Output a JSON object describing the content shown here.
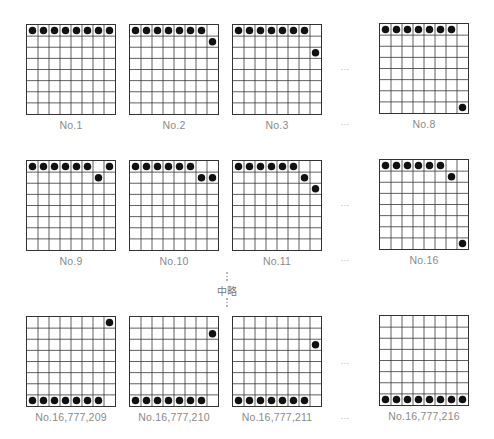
{
  "diagram": {
    "grid_size": 8,
    "colors": {
      "line": "#333333",
      "stone": "#111111",
      "label": "#8a8a8a"
    },
    "omission_label": "中略",
    "ellipsis": "…",
    "boards": [
      {
        "label": "No.1",
        "x": 26,
        "y": 24,
        "stones": [
          [
            0,
            0
          ],
          [
            0,
            1
          ],
          [
            0,
            2
          ],
          [
            0,
            3
          ],
          [
            0,
            4
          ],
          [
            0,
            5
          ],
          [
            0,
            6
          ],
          [
            0,
            7
          ]
        ]
      },
      {
        "label": "No.2",
        "x": 129,
        "y": 24,
        "stones": [
          [
            0,
            0
          ],
          [
            0,
            1
          ],
          [
            0,
            2
          ],
          [
            0,
            3
          ],
          [
            0,
            4
          ],
          [
            0,
            5
          ],
          [
            0,
            6
          ],
          [
            1,
            7
          ]
        ]
      },
      {
        "label": "No.3",
        "x": 232,
        "y": 24,
        "stones": [
          [
            0,
            0
          ],
          [
            0,
            1
          ],
          [
            0,
            2
          ],
          [
            0,
            3
          ],
          [
            0,
            4
          ],
          [
            0,
            5
          ],
          [
            0,
            6
          ],
          [
            2,
            7
          ]
        ]
      },
      {
        "label": "No.8",
        "x": 379,
        "y": 23,
        "stones": [
          [
            0,
            0
          ],
          [
            0,
            1
          ],
          [
            0,
            2
          ],
          [
            0,
            3
          ],
          [
            0,
            4
          ],
          [
            0,
            5
          ],
          [
            0,
            6
          ],
          [
            7,
            7
          ]
        ]
      },
      {
        "label": "No.9",
        "x": 26,
        "y": 160,
        "stones": [
          [
            0,
            0
          ],
          [
            0,
            1
          ],
          [
            0,
            2
          ],
          [
            0,
            3
          ],
          [
            0,
            4
          ],
          [
            0,
            5
          ],
          [
            1,
            6
          ],
          [
            0,
            7
          ]
        ]
      },
      {
        "label": "No.10",
        "x": 129,
        "y": 160,
        "stones": [
          [
            0,
            0
          ],
          [
            0,
            1
          ],
          [
            0,
            2
          ],
          [
            0,
            3
          ],
          [
            0,
            4
          ],
          [
            0,
            5
          ],
          [
            1,
            6
          ],
          [
            1,
            7
          ]
        ]
      },
      {
        "label": "No.11",
        "x": 232,
        "y": 160,
        "stones": [
          [
            0,
            0
          ],
          [
            0,
            1
          ],
          [
            0,
            2
          ],
          [
            0,
            3
          ],
          [
            0,
            4
          ],
          [
            0,
            5
          ],
          [
            1,
            6
          ],
          [
            2,
            7
          ]
        ]
      },
      {
        "label": "No.16",
        "x": 379,
        "y": 159,
        "stones": [
          [
            0,
            0
          ],
          [
            0,
            1
          ],
          [
            0,
            2
          ],
          [
            0,
            3
          ],
          [
            0,
            4
          ],
          [
            0,
            5
          ],
          [
            1,
            6
          ],
          [
            7,
            7
          ]
        ]
      },
      {
        "label": "No.16,777,209",
        "x": 26,
        "y": 316,
        "stones": [
          [
            7,
            0
          ],
          [
            7,
            1
          ],
          [
            7,
            2
          ],
          [
            7,
            3
          ],
          [
            7,
            4
          ],
          [
            7,
            5
          ],
          [
            7,
            6
          ],
          [
            0,
            7
          ]
        ]
      },
      {
        "label": "No.16,777,210",
        "x": 129,
        "y": 316,
        "stones": [
          [
            7,
            0
          ],
          [
            7,
            1
          ],
          [
            7,
            2
          ],
          [
            7,
            3
          ],
          [
            7,
            4
          ],
          [
            7,
            5
          ],
          [
            7,
            6
          ],
          [
            1,
            7
          ]
        ]
      },
      {
        "label": "No.16,777,211",
        "x": 232,
        "y": 316,
        "stones": [
          [
            7,
            0
          ],
          [
            7,
            1
          ],
          [
            7,
            2
          ],
          [
            7,
            3
          ],
          [
            7,
            4
          ],
          [
            7,
            5
          ],
          [
            7,
            6
          ],
          [
            2,
            7
          ]
        ]
      },
      {
        "label": "No.16,777,216",
        "x": 379,
        "y": 315,
        "stones": [
          [
            7,
            0
          ],
          [
            7,
            1
          ],
          [
            7,
            2
          ],
          [
            7,
            3
          ],
          [
            7,
            4
          ],
          [
            7,
            5
          ],
          [
            7,
            6
          ],
          [
            7,
            7
          ]
        ]
      }
    ],
    "ellipses": [
      {
        "x": 335,
        "y": 62
      },
      {
        "x": 335,
        "y": 117
      },
      {
        "x": 335,
        "y": 198
      },
      {
        "x": 335,
        "y": 253
      },
      {
        "x": 335,
        "y": 356
      },
      {
        "x": 335,
        "y": 411
      }
    ]
  }
}
